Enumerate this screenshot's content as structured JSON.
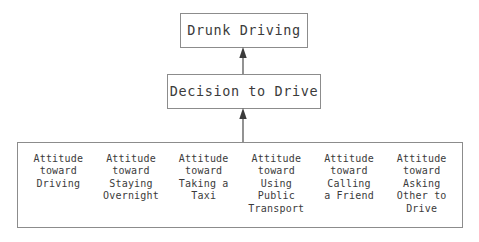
{
  "diagram": {
    "title_node": {
      "id": "drunk-driving",
      "label": "Drunk Driving"
    },
    "decision_node": {
      "id": "decision-to-drive",
      "label": "Decision to Drive"
    },
    "attitudes_group": {
      "id": "attitudes",
      "items": [
        {
          "id": "attitude-driving",
          "label": "Attitude\ntoward\nDriving"
        },
        {
          "id": "attitude-staying-overnight",
          "label": "Attitude\ntoward\nStaying\nOvernight"
        },
        {
          "id": "attitude-taking-taxi",
          "label": "Attitude\ntoward\nTaking a\nTaxi"
        },
        {
          "id": "attitude-public-transport",
          "label": "Attitude\ntoward\nUsing\nPublic\nTransport"
        },
        {
          "id": "attitude-calling-friend",
          "label": "Attitude\ntoward\nCalling\na Friend"
        },
        {
          "id": "attitude-asking-other-to-drive",
          "label": "Attitude\ntoward\nAsking\nOther to\nDrive"
        }
      ]
    },
    "edges": [
      {
        "id": "edge-decision-to-drunk-driving",
        "from": "decision-to-drive",
        "to": "drunk-driving",
        "direction": "up"
      },
      {
        "id": "edge-attitudes-to-decision",
        "from": "attitudes",
        "to": "decision-to-drive",
        "direction": "up"
      }
    ],
    "colors": {
      "border": "#8c8c8c",
      "text": "#3b3b3b",
      "background": "#ffffff",
      "arrow": "#4a4a4a"
    }
  }
}
